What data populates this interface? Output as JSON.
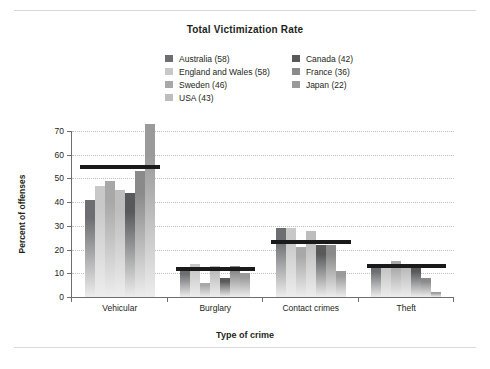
{
  "chart_data": {
    "type": "bar",
    "title": "Total Victimization Rate",
    "xlabel": "Type of crime",
    "ylabel": "Percent of offenses",
    "ylim": [
      0,
      70
    ],
    "yticks": [
      0,
      10,
      20,
      30,
      40,
      50,
      60,
      70
    ],
    "grid": true,
    "legend_position": "top-center",
    "categories": [
      "Vehicular",
      "Burglary",
      "Contact crimes",
      "Theft"
    ],
    "series": [
      {
        "name": "Australia (58)",
        "color": "#6d6e71",
        "values": [
          41,
          12,
          29,
          13
        ]
      },
      {
        "name": "England and Wales (58)",
        "color": "#c8c8c8",
        "values": [
          47,
          14,
          29,
          13
        ]
      },
      {
        "name": "Sweden (46)",
        "color": "#a8a8a8",
        "values": [
          49,
          6,
          21,
          15
        ]
      },
      {
        "name": "USA (43)",
        "color": "#bdbdbd",
        "values": [
          45,
          13,
          28,
          14
        ]
      },
      {
        "name": "Canada (42)",
        "color": "#58595b",
        "values": [
          44,
          8,
          22,
          13
        ]
      },
      {
        "name": "France (36)",
        "color": "#8a8a8a",
        "values": [
          53,
          13,
          22,
          8
        ]
      },
      {
        "name": "Japan (22)",
        "color": "#9a9a9a",
        "values": [
          73,
          10,
          11,
          2
        ]
      }
    ],
    "reference_lines": [
      {
        "category": "Vehicular",
        "value": 55
      },
      {
        "category": "Burglary",
        "value": 12
      },
      {
        "category": "Contact crimes",
        "value": 23
      },
      {
        "category": "Theft",
        "value": 13
      }
    ],
    "reference_line_color": "#1a1a1a"
  },
  "legend": {
    "left_column": [
      {
        "label": "Australia (58)",
        "color": "#6d6e71"
      },
      {
        "label": "England and Wales (58)",
        "color": "#c8c8c8"
      },
      {
        "label": "Sweden (46)",
        "color": "#a8a8a8"
      },
      {
        "label": "USA (43)",
        "color": "#bdbdbd"
      }
    ],
    "right_column": [
      {
        "label": "Canada (42)",
        "color": "#58595b"
      },
      {
        "label": "France (36)",
        "color": "#8a8a8a"
      },
      {
        "label": "Japan (22)",
        "color": "#9a9a9a"
      }
    ]
  }
}
